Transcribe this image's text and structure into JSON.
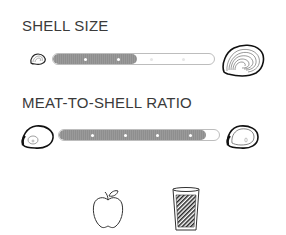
{
  "sections": [
    {
      "title": "SHELL SIZE",
      "scale": {
        "min_icon": "small-oyster-shell-icon",
        "max_icon": "large-oyster-shell-icon",
        "filled_fraction": 0.52,
        "ticks": 4,
        "filled_ticks": 2
      }
    },
    {
      "title": "MEAT-TO-SHELL RATIO",
      "scale": {
        "min_icon": "low-meat-oyster-icon",
        "max_icon": "high-meat-oyster-icon",
        "filled_fraction": 0.92,
        "ticks": 4,
        "filled_ticks": 4
      }
    }
  ],
  "pairing_icons": [
    "apple-icon",
    "glass-icon"
  ],
  "colors": {
    "title": "#3a3a3a",
    "bar_fill": "#939393",
    "bar_border": "#bdbdbd",
    "icon_stroke": "#222222"
  }
}
